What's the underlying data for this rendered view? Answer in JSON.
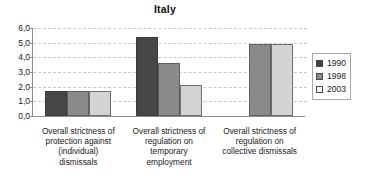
{
  "chart_data": {
    "type": "bar",
    "title": "Italy",
    "xlabel": "",
    "ylabel": "",
    "ylim": [
      0,
      6
    ],
    "ytick_step": 1,
    "ytick_labels": [
      "0,0",
      "1,0",
      "2,0",
      "3,0",
      "4,0",
      "5,0",
      "6,0"
    ],
    "grid": true,
    "legend_position": "right",
    "categories": [
      "Overall strictness of protection against (individual) dismissals",
      "Overall strictness of regulation on temporary employment",
      "Overall strictness of regulation on collective dismissals"
    ],
    "category_lines": [
      [
        "Overall strictness of",
        "protection against",
        "(individual)",
        "dismissals"
      ],
      [
        "Overall strictness of",
        "regulation on",
        "temporary",
        "employment"
      ],
      [
        "Overall strictness of",
        "regulation on",
        "collective dismissals"
      ]
    ],
    "series": [
      {
        "name": "1990",
        "color": "#474747",
        "values": [
          1.7,
          5.4,
          null
        ]
      },
      {
        "name": "1998",
        "color": "#8a8a8a",
        "values": [
          1.7,
          3.6,
          4.9
        ]
      },
      {
        "name": "2003",
        "color": "#d4d4d4",
        "values": [
          1.7,
          2.1,
          4.9
        ]
      }
    ]
  },
  "legend": {
    "items": [
      {
        "label": "1990"
      },
      {
        "label": "1998"
      },
      {
        "label": "2003"
      }
    ]
  },
  "colors": {
    "series_1990": "#474747",
    "series_1998": "#8a8a8a",
    "series_2003": "#d4d4d4",
    "axis": "#8d8d8d",
    "gridline": "#c9c9c9",
    "background": "#ffffff"
  }
}
